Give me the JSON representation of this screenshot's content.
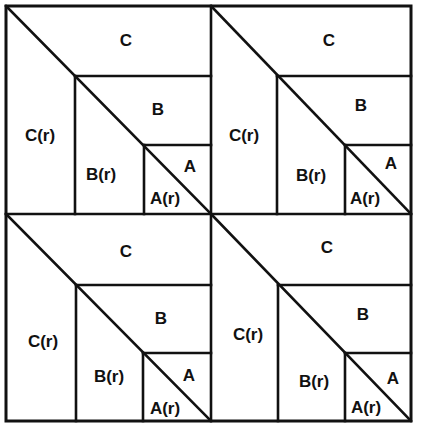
{
  "diagram": {
    "colors": {
      "line": "#111111",
      "background": "#ffffff",
      "text": "#111111"
    },
    "tiles": [
      {
        "id": "top-left",
        "labels": {
          "C": "C",
          "Cr": "C(r)",
          "B": "B",
          "Br": "B(r)",
          "A": "A",
          "Ar": "A(r)"
        }
      },
      {
        "id": "top-right",
        "labels": {
          "C": "C",
          "Cr": "C(r)",
          "B": "B",
          "Br": "B(r)",
          "A": "A",
          "Ar": "A(r)"
        }
      },
      {
        "id": "bottom-left",
        "labels": {
          "C": "C",
          "Cr": "C(r)",
          "B": "B",
          "Br": "B(r)",
          "A": "A",
          "Ar": "A(r)"
        }
      },
      {
        "id": "bottom-right",
        "labels": {
          "C": "C",
          "Cr": "C(r)",
          "B": "B",
          "Br": "B(r)",
          "A": "A",
          "Ar": "A(r)"
        }
      }
    ]
  }
}
